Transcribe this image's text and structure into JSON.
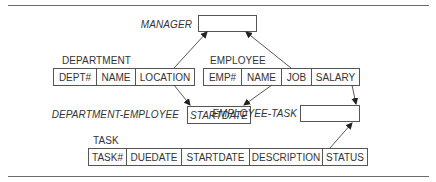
{
  "diagram": {
    "type": "relational-schema-dependency",
    "relations": {
      "manager": {
        "name": "MANAGER",
        "attributes": []
      },
      "department": {
        "name": "DEPARTMENT",
        "attributes": [
          "DEPT#",
          "NAME",
          "LOCATION"
        ]
      },
      "employee": {
        "name": "EMPLOYEE",
        "attributes": [
          "EMP#",
          "NAME",
          "JOB",
          "SALARY"
        ]
      },
      "department_employee": {
        "name": "DEPARTMENT-EMPLOYEE",
        "attributes": [
          "STARTDATE"
        ]
      },
      "employee_task": {
        "name": "EMPLOYEE-TASK",
        "attributes": []
      },
      "task": {
        "name": "TASK",
        "attributes": [
          "TASK#",
          "DUEDATE",
          "STARTDATE",
          "DESCRIPTION",
          "STATUS"
        ]
      }
    },
    "arrows": [
      {
        "from": "DEPARTMENT.LOCATION",
        "to": "MANAGER"
      },
      {
        "from": "EMPLOYEE.JOB",
        "to": "MANAGER"
      },
      {
        "from": "DEPARTMENT.LOCATION",
        "to": "DEPARTMENT-EMPLOYEE"
      },
      {
        "from": "EMPLOYEE.NAME",
        "to": "DEPARTMENT-EMPLOYEE"
      },
      {
        "from": "EMPLOYEE.SALARY",
        "to": "EMPLOYEE-TASK"
      },
      {
        "from": "TASK.STATUS",
        "to": "EMPLOYEE-TASK"
      }
    ],
    "colors": {
      "line": "#555555",
      "text": "#333333",
      "rule": "#6a6a6a"
    }
  }
}
